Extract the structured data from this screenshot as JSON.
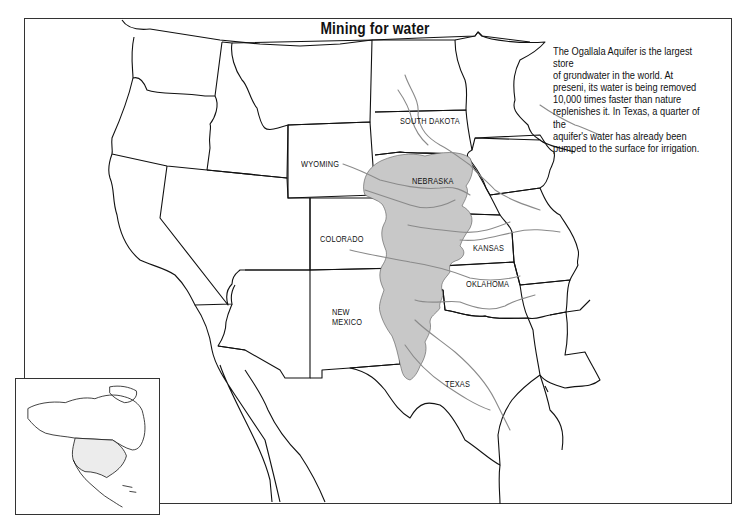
{
  "map": {
    "title": "Mining for water",
    "description": "The Ogallala Aquifer is the largest store\nof grʊndwater in the world. At\npreseni, its water is being removed\n10,000 times faster than nature\nreplenishes it. In Texas, a quarter of the\naquifer's water has already been\npumped to the surface for irrigation.",
    "state_labels": {
      "south_dakota": "SOUTH DAKOTA",
      "wyoming": "WYOMING",
      "nebraska": "NEBRASKA",
      "colorado": "COLORADO",
      "kansas": "KANSAS",
      "oklahoma": "OKLAHOMA",
      "new_mexico": "NEW\nMEXICO",
      "texas": "TEXAS"
    },
    "legend": {
      "aquifer_fill": "#c8c8c8",
      "river_color": "#8a8a8a",
      "border_color": "#111111"
    },
    "inset": {
      "label": "North America locator"
    }
  }
}
